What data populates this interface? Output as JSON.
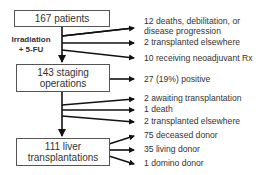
{
  "diagram": {
    "boxes": [
      {
        "id": "patients",
        "lines": [
          "167 patients"
        ]
      },
      {
        "id": "staging",
        "lines": [
          "143 staging",
          "operations"
        ]
      },
      {
        "id": "transplants",
        "lines": [
          "111 liver",
          "transplantations"
        ]
      }
    ],
    "side_label": [
      "Irradiation",
      "+ 5-FU"
    ],
    "outcomes": {
      "patients": [
        [
          "12 deaths, debilitation, or",
          "disease progression"
        ],
        [
          "2 transplanted elsewhere"
        ],
        [
          "10 receiving neoadjuvant Rx"
        ]
      ],
      "staging": [
        [
          "27 (19%) positive"
        ],
        [
          "2 awaiting transplantation"
        ],
        [
          "1 death"
        ],
        [
          "2 transplanted elsewhere"
        ]
      ],
      "transplants": [
        [
          "75 deceased donor"
        ],
        [
          "35 living donor"
        ],
        [
          "1 domino donor"
        ]
      ]
    }
  }
}
